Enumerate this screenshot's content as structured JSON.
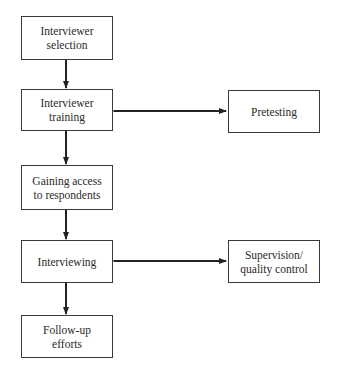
{
  "diagram": {
    "type": "flowchart",
    "main_steps": [
      {
        "id": "interviewer-selection",
        "label": "Interviewer\nselection"
      },
      {
        "id": "interviewer-training",
        "label": "Interviewer\ntraining"
      },
      {
        "id": "gaining-access",
        "label": "Gaining access\nto respondents"
      },
      {
        "id": "interviewing",
        "label": "Interviewing"
      },
      {
        "id": "follow-up",
        "label": "Follow-up\nefforts"
      }
    ],
    "side_steps": [
      {
        "id": "pretesting",
        "label": "Pretesting",
        "linked_to": "interviewer-training",
        "arrow": "bidirectional"
      },
      {
        "id": "supervision",
        "label": "Supervision/\nquality control",
        "linked_to": "interviewing",
        "arrow": "bidirectional"
      }
    ],
    "edges": [
      {
        "from": "interviewer-selection",
        "to": "interviewer-training"
      },
      {
        "from": "interviewer-training",
        "to": "gaining-access"
      },
      {
        "from": "gaining-access",
        "to": "interviewing"
      },
      {
        "from": "interviewing",
        "to": "follow-up"
      },
      {
        "from": "interviewer-training",
        "to": "pretesting",
        "bidirectional": true
      },
      {
        "from": "interviewing",
        "to": "supervision",
        "bidirectional": true
      }
    ]
  }
}
